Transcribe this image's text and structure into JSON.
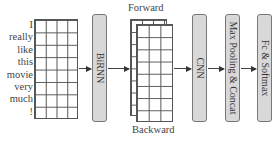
{
  "diagram": {
    "input_words": [
      "I",
      "really",
      "like",
      "this",
      "movie",
      "very",
      "much",
      "!"
    ],
    "embedding_grid": {
      "rows": 8,
      "cols": 4
    },
    "stages": [
      {
        "id": "birnn",
        "label": "BiRNN"
      },
      {
        "id": "cnn",
        "label": "CNN"
      },
      {
        "id": "maxpool",
        "label": "Max Pooling & Concat"
      },
      {
        "id": "fc",
        "label": "Fc & Softmax"
      }
    ],
    "birnn_output": {
      "top_label": "Forward",
      "bottom_label": "Backward",
      "grid": {
        "rows": 8,
        "cols": 3
      }
    },
    "colors": {
      "box_fill": "#d8d8d8",
      "box_border": "#777777",
      "line": "#444444"
    }
  }
}
